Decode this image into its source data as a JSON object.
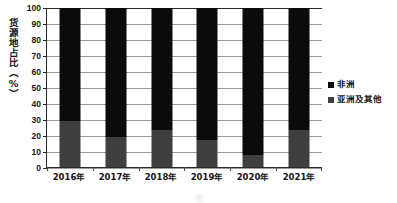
{
  "chart_data": {
    "type": "bar",
    "stacked": true,
    "title": "",
    "subtitle": "",
    "xlabel": "",
    "ylabel": "货源地占比（%）",
    "categories": [
      "2016年",
      "2017年",
      "2018年",
      "2019年",
      "2020年",
      "2021年"
    ],
    "series": [
      {
        "name": "非洲",
        "color": "#0b0b0b",
        "values": [
          71,
          81,
          77,
          83,
          92.5,
          77
        ]
      },
      {
        "name": "亚洲及其他",
        "color": "#3f3f3f",
        "values": [
          29,
          19,
          23,
          17,
          7.5,
          23
        ]
      }
    ],
    "ylim": [
      0,
      100
    ],
    "yticks": [
      0,
      10,
      20,
      30,
      40,
      50,
      60,
      70,
      80,
      90,
      100
    ],
    "ytick_labels": [
      "0",
      "10",
      "20",
      "30",
      "40",
      "50",
      "60",
      "70",
      "80",
      "90",
      "100"
    ],
    "grid": true,
    "grid_axis": "y",
    "legend_position": "right"
  },
  "axes": {
    "y_title": "货源地占比（%）",
    "y_ticks": [
      "100",
      "90",
      "80",
      "70",
      "60",
      "50",
      "40",
      "30",
      "20",
      "10",
      "0"
    ],
    "x_ticks": [
      "2016年",
      "2017年",
      "2018年",
      "2019年",
      "2020年",
      "2021年"
    ]
  },
  "legend": {
    "items": [
      {
        "label": "非洲",
        "swatch": "africa"
      },
      {
        "label": "亚洲及其他",
        "swatch": "asia"
      }
    ]
  },
  "caption": {
    "text": "图"
  }
}
